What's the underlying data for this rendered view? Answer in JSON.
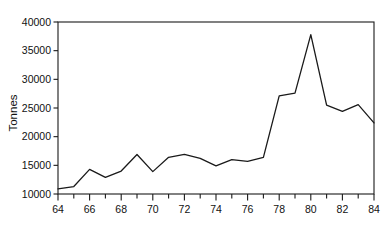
{
  "chart_data": {
    "type": "line",
    "title": "",
    "subtitle": "",
    "xlabel": "",
    "ylabel": "Tonnes",
    "x": [
      64,
      65,
      66,
      67,
      68,
      69,
      70,
      71,
      72,
      73,
      74,
      75,
      76,
      77,
      78,
      79,
      80,
      81,
      82,
      83,
      84
    ],
    "values": [
      10900,
      11300,
      14300,
      12900,
      14000,
      16900,
      13900,
      16400,
      16900,
      16200,
      14900,
      16000,
      15700,
      16400,
      27100,
      27600,
      37800,
      25500,
      24400,
      25600,
      22400
    ],
    "series": [
      {
        "name": "Tonnes",
        "values": [
          10900,
          11300,
          14300,
          12900,
          14000,
          16900,
          13900,
          16400,
          16900,
          16200,
          14900,
          16000,
          15700,
          16400,
          27100,
          27600,
          37800,
          25500,
          24400,
          25600,
          22400
        ]
      }
    ],
    "xlim": [
      64,
      84
    ],
    "ylim": [
      10000,
      40000
    ],
    "x_major_ticks": [
      64,
      66,
      68,
      70,
      72,
      74,
      76,
      78,
      80,
      82,
      84
    ],
    "x_minor_ticks": [
      65,
      67,
      69,
      71,
      73,
      75,
      77,
      79,
      81,
      83
    ],
    "x_tick_labels": [
      "64",
      "66",
      "68",
      "70",
      "72",
      "74",
      "76",
      "78",
      "80",
      "82",
      "84"
    ],
    "y_ticks": [
      10000,
      15000,
      20000,
      25000,
      30000,
      35000,
      40000
    ],
    "y_tick_labels": [
      "10000",
      "15000",
      "20000",
      "25000",
      "30000",
      "35000",
      "40000"
    ],
    "grid": false,
    "legend": false,
    "legend_position": "none",
    "line_color": "#1a1a1a",
    "frame_color": "#1a1a1a",
    "background_color": "#ffffff",
    "annotations": []
  },
  "axes": {
    "y_axis_title": "Tonnes"
  }
}
